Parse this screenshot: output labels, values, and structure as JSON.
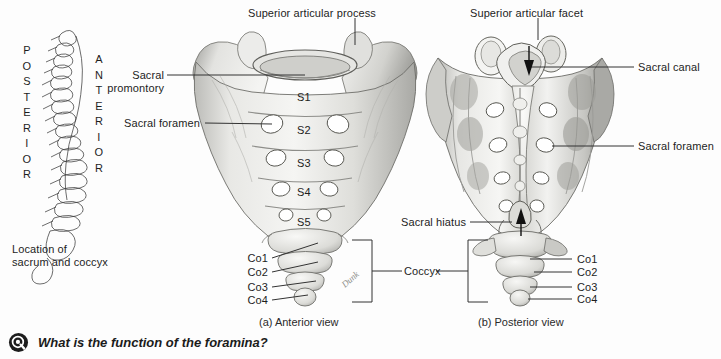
{
  "figure": {
    "orientation_labels": {
      "posterior": "POSTERIOR",
      "anterior": "ANTERIOR"
    },
    "locator": {
      "caption_line1": "Location of",
      "caption_line2": "sacrum and coccyx",
      "icon": "lateral-vertebral-column-outline"
    },
    "panels": [
      {
        "id": "a",
        "caption": "(a) Anterior view",
        "labels": [
          {
            "name": "superior-articular-process",
            "text": "Superior articular process"
          },
          {
            "name": "sacral-promontory",
            "text": "Sacral\npromontory"
          },
          {
            "name": "sacral-foramen",
            "text": "Sacral foramen"
          },
          {
            "name": "coccyx",
            "text": "Coccyx"
          }
        ],
        "vertebra_labels": [
          "S1",
          "S2",
          "S3",
          "S4",
          "S5"
        ],
        "coccygeal_labels": [
          "Co1",
          "Co2",
          "Co3",
          "Co4"
        ],
        "artist_signature": "Dunk"
      },
      {
        "id": "b",
        "caption": "(b) Posterior view",
        "labels": [
          {
            "name": "superior-articular-facet",
            "text": "Superior articular facet"
          },
          {
            "name": "sacral-canal",
            "text": "Sacral canal"
          },
          {
            "name": "sacral-foramen",
            "text": "Sacral foramen"
          },
          {
            "name": "sacral-hiatus",
            "text": "Sacral hiatus"
          }
        ],
        "coccygeal_labels": [
          "Co1",
          "Co2",
          "Co3",
          "Co4"
        ]
      }
    ]
  },
  "question_bar": {
    "icon": "question-circle-icon",
    "text": "What is the function of the foramina?"
  },
  "colors": {
    "background": "#fdfdfd",
    "text": "#1d1d1d",
    "leader_line": "#333333",
    "bone_light": "#f2f2f0",
    "bone_mid": "#cfcfcc",
    "bone_dark": "#9a9a97",
    "icon_dark": "#1d1d1d"
  }
}
